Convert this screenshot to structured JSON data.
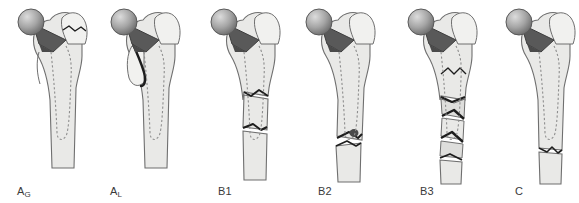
{
  "figure": {
    "type": "medical-illustration",
    "orientation": "anterior view, left proximal femur with cemented hip stem prosthesis",
    "panel_count": 6,
    "background_color": "#ffffff"
  },
  "colors": {
    "bone_fill": "#e9e9e7",
    "bone_fill_light": "#f1f1ef",
    "bone_outline": "#6f6f6f",
    "prosthesis_neck": "#595959",
    "prosthesis_neck_dark": "#4a4a4a",
    "head_highlight": "#d9d9d9",
    "head_shadow": "#6a6a6a",
    "stem_dashed": "#8e8e8e",
    "fracture_line": "#1d1d1d",
    "fragment_fill": "#dededc",
    "caption_text": "#3a3a3a"
  },
  "panels": [
    {
      "id": "ag",
      "label_main": "A",
      "label_sub": "G",
      "label_full": "AG",
      "fracture_site": "greater trochanter",
      "fracture_description": "Fracture of the greater trochanter, prosthesis stable",
      "x": 6,
      "caption_x": 17,
      "shaft_center": 60,
      "comminuted": false,
      "shaft_break": false
    },
    {
      "id": "al",
      "label_main": "A",
      "label_sub": "L",
      "label_full": "AL",
      "fracture_site": "lesser trochanter",
      "fracture_description": "Fracture of the lesser trochanter, prosthesis stable",
      "x": 99,
      "caption_x": 110,
      "shaft_center": 145,
      "comminuted": false,
      "shaft_break": false
    },
    {
      "id": "b1",
      "label_main": "B1",
      "label_sub": "",
      "label_full": "B1",
      "fracture_site": "around or just below the stem, prosthesis stable",
      "fracture_description": "Fracture about the stem with a well-fixed prosthesis",
      "x": 199,
      "caption_x": 218,
      "shaft_center": 245,
      "comminuted": false,
      "shaft_break": true
    },
    {
      "id": "b2",
      "label_main": "B2",
      "label_sub": "",
      "label_full": "B2",
      "fracture_site": "around the stem tip, prosthesis loose",
      "fracture_description": "Fracture about the stem with a loose prosthesis, adequate bone stock",
      "x": 294,
      "caption_x": 318,
      "shaft_center": 340,
      "comminuted": false,
      "shaft_break": true
    },
    {
      "id": "b3",
      "label_main": "B3",
      "label_sub": "",
      "label_full": "B3",
      "fracture_site": "around the stem with poor bone stock",
      "fracture_description": "Fracture about the stem, loose prosthesis with severe comminution and poor bone stock",
      "x": 396,
      "caption_x": 420,
      "shaft_center": 440,
      "comminuted": true,
      "shaft_break": true
    },
    {
      "id": "c",
      "label_main": "C",
      "label_sub": "",
      "label_full": "C",
      "fracture_site": "well below the prosthesis tip",
      "fracture_description": "Fracture well below the tip of the prosthesis",
      "x": 494,
      "caption_x": 515,
      "shaft_center": 540,
      "comminuted": false,
      "shaft_break": false
    }
  ]
}
